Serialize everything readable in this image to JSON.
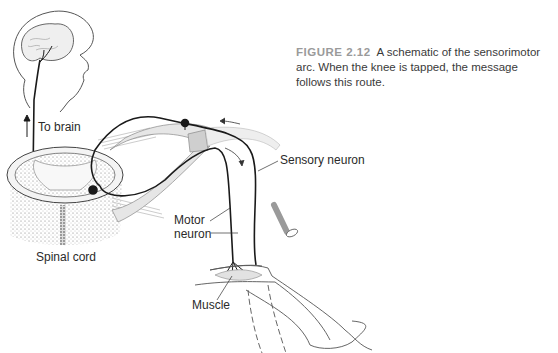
{
  "figure": {
    "label": "FIGURE 2.12",
    "caption": "A schematic of the sensorimotor arc. When the knee is tapped, the message follows this route."
  },
  "labels": {
    "to_brain": "To brain",
    "sensory_neuron": "Sensory neuron",
    "motor_neuron_line1": "Motor",
    "motor_neuron_line2": "neuron",
    "spinal_cord": "Spinal cord",
    "muscle": "Muscle"
  },
  "colors": {
    "ink": "#1a1a1a",
    "nerve_fill": "#e6e6e6",
    "hammer": "#9a9a9a",
    "caption_label": "#9a9a9a",
    "caption_text": "#3a3a3a"
  }
}
